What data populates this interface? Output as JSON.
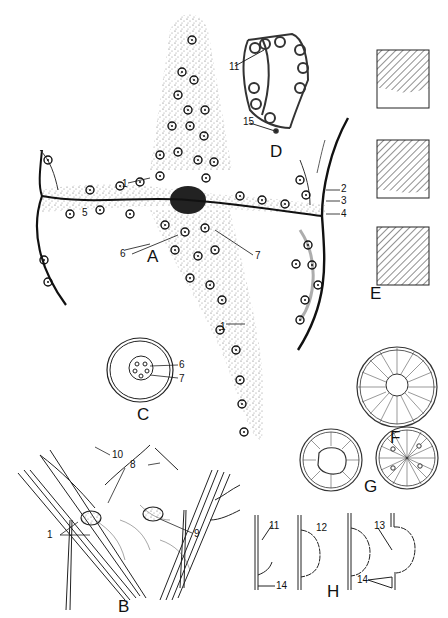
{
  "plate": {
    "type": "scientific-illustration",
    "style": "black-and-white ink drawing",
    "figures": [
      {
        "letter": "A",
        "description": "stippled tissue cross with many cell nuclei, central dark junction, curved boundary lines left and right",
        "callouts": [
          "1",
          "1",
          "2",
          "3",
          "4",
          "5",
          "6",
          "7"
        ]
      },
      {
        "letter": "B",
        "description": "two fibrous bundles crossing with knotted nodes and fine network",
        "callouts": [
          "1",
          "8",
          "9",
          "10"
        ]
      },
      {
        "letter": "C",
        "description": "double-walled oval with small rosette of cells inside",
        "callouts": [
          "6",
          "7"
        ]
      },
      {
        "letter": "D",
        "description": "polygonal cellular network of thick-walled cells",
        "callouts": [
          "11",
          "15"
        ]
      },
      {
        "letter": "E",
        "description": "three hatched rectangles showing progressive boundary stages",
        "callouts": []
      },
      {
        "letter": "F",
        "description": "radially striated disc with central clear circle",
        "callouts": []
      },
      {
        "letter": "G",
        "description": "two radially striated discs, one with irregular center, one with dots",
        "callouts": []
      },
      {
        "letter": "H",
        "description": "four line diagrams of vertical wall with bulging semicircular outgrowth",
        "callouts": [
          "11",
          "12",
          "13",
          "14",
          "14"
        ]
      }
    ]
  },
  "labels": {
    "A": "A",
    "B": "B",
    "C": "C",
    "D": "D",
    "E": "E",
    "F": "F",
    "G": "G",
    "H": "H",
    "n1a": "1",
    "n1b": "1",
    "n2": "2",
    "n3": "3",
    "n4": "4",
    "n5": "5",
    "n6a": "6",
    "n7a": "7",
    "n6c": "6",
    "n7c": "7",
    "n11d": "11",
    "n15": "15",
    "n10": "10",
    "n8": "8",
    "n1B": "1",
    "n9": "9",
    "n11h": "11",
    "n12": "12",
    "n13": "13",
    "n14a": "14",
    "n14b": "14"
  },
  "colors": {
    "ink": "#111111",
    "stipple": "#555555",
    "paper": "#ffffff"
  }
}
